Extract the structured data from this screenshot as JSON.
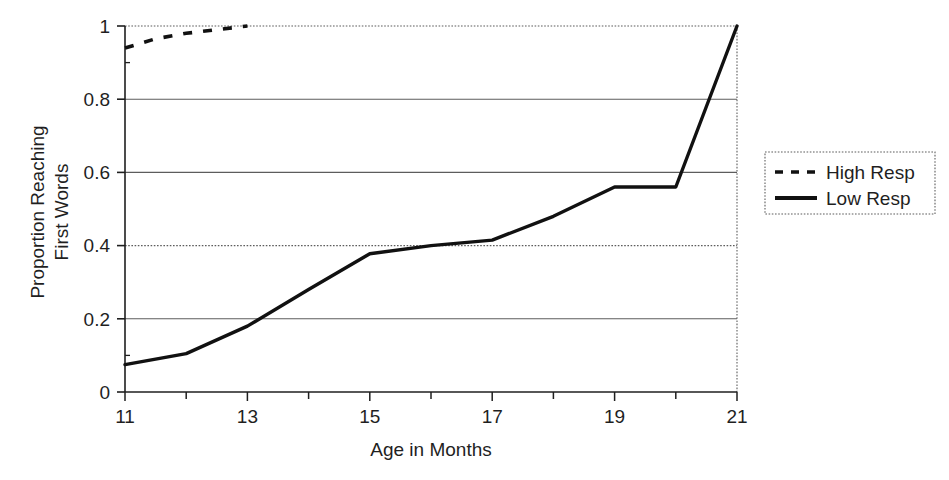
{
  "chart_data": {
    "type": "line",
    "title": "",
    "xlabel": "Age in Months",
    "ylabel": "Proportion Reaching First Words",
    "ylabel_lines": [
      "Proportion Reaching",
      "First Words"
    ],
    "xlim": [
      11,
      21
    ],
    "ylim": [
      0,
      1
    ],
    "grid": true,
    "grid_axis": "y",
    "legend_position": "right",
    "x_tick_labels": [
      "11",
      "13",
      "15",
      "17",
      "19",
      "21"
    ],
    "x_tick_values": [
      11,
      13,
      15,
      17,
      19,
      21
    ],
    "x_minor_tick_values": [
      12,
      14,
      16,
      18,
      20
    ],
    "y_tick_labels": [
      "0",
      "0.2",
      "0.4",
      "0.6",
      "0.8",
      "1"
    ],
    "y_tick_values": [
      0,
      0.2,
      0.4,
      0.6,
      0.8,
      1
    ],
    "series": [
      {
        "name": "High Resp",
        "style": "dashed",
        "color": "#111111",
        "x": [
          11,
          11.5,
          12,
          12.5,
          13
        ],
        "values": [
          0.94,
          0.965,
          0.98,
          0.99,
          1.0
        ]
      },
      {
        "name": "Low Resp",
        "style": "solid",
        "color": "#111111",
        "x": [
          11,
          12,
          13,
          14,
          15,
          16,
          17,
          18,
          19,
          20,
          21
        ],
        "values": [
          0.075,
          0.105,
          0.18,
          0.28,
          0.378,
          0.4,
          0.415,
          0.48,
          0.56,
          0.56,
          1.0
        ]
      }
    ]
  },
  "legend": {
    "entries": [
      {
        "label": "High Resp",
        "style": "dashed"
      },
      {
        "label": "Low Resp",
        "style": "solid"
      }
    ]
  },
  "axes": {
    "x_title": "Age in Months",
    "y_title_line1": "Proportion Reaching",
    "y_title_line2": "First Words"
  },
  "ticks": {
    "y": [
      "1",
      "0.8",
      "0.6",
      "0.4",
      "0.2",
      "0"
    ],
    "x": [
      "11",
      "13",
      "15",
      "17",
      "19",
      "21"
    ]
  },
  "colors": {
    "line": "#111111",
    "grid": "#6f6f6f",
    "axis": "#1f1f1f",
    "background": "#ffffff"
  }
}
